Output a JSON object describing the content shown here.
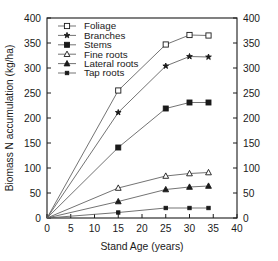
{
  "chart_data": {
    "type": "line",
    "title": "",
    "xlabel": "Stand Age (years)",
    "ylabel": "Biomass N accumulation (kg/ha)",
    "xlim": [
      0,
      40
    ],
    "ylim": [
      0,
      400
    ],
    "xticks": [
      0,
      5,
      10,
      15,
      20,
      25,
      30,
      35,
      40
    ],
    "yticks": [
      0,
      50,
      100,
      150,
      200,
      250,
      300,
      350,
      400
    ],
    "xticklabels": [
      "0",
      "5",
      "10",
      "15",
      "20",
      "25",
      "30",
      "35",
      "40"
    ],
    "yticklabels": [
      "0",
      "50",
      "100",
      "150",
      "200",
      "250",
      "300",
      "350",
      "400"
    ],
    "right_axis": true,
    "right_yticklabels": [
      "0",
      "50",
      "100",
      "150",
      "200",
      "250",
      "300",
      "350",
      "400"
    ],
    "grid": false,
    "legend_position": "upper left",
    "x": [
      0,
      15,
      25,
      30,
      34
    ],
    "series": [
      {
        "name": "Foliage",
        "marker": "open-square",
        "values": [
          0,
          255,
          347,
          366,
          365
        ]
      },
      {
        "name": "Branches",
        "marker": "filled-star",
        "values": [
          0,
          211,
          304,
          323,
          322
        ]
      },
      {
        "name": "Stems",
        "marker": "filled-square",
        "values": [
          0,
          141,
          219,
          231,
          231
        ]
      },
      {
        "name": "Fine roots",
        "marker": "open-triangle",
        "values": [
          0,
          60,
          84,
          89,
          91
        ]
      },
      {
        "name": "Lateral roots",
        "marker": "filled-triangle",
        "values": [
          0,
          33,
          57,
          62,
          64
        ]
      },
      {
        "name": "Tap roots",
        "marker": "small-dot",
        "values": [
          0,
          11,
          20,
          20,
          20
        ]
      }
    ]
  },
  "legend": {
    "items": [
      {
        "label": "Foliage"
      },
      {
        "label": "Branches"
      },
      {
        "label": "Stems"
      },
      {
        "label": "Fine roots"
      },
      {
        "label": "Lateral roots"
      },
      {
        "label": "Tap roots"
      }
    ]
  },
  "colors": {
    "axis": "#1a1a1a",
    "line": "#5a5a5a",
    "marker_fill": "#1a1a1a",
    "marker_open": "#ffffff",
    "background": "#ffffff"
  },
  "caption": {
    "text": ""
  }
}
